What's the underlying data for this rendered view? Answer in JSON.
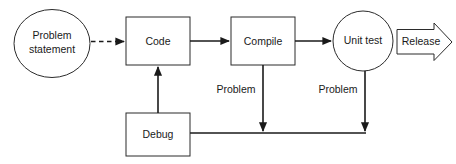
{
  "diagram": {
    "background_color": "#ffffff",
    "stroke_color": "#1a1a1a",
    "shape_stroke_color": "#2b2b2b",
    "nodes": [
      {
        "id": "problem-statement",
        "label_line1": "Problem",
        "label_line2": "statement",
        "shape": "ellipse"
      },
      {
        "id": "code",
        "label": "Code",
        "shape": "rectangle"
      },
      {
        "id": "compile",
        "label": "Compile",
        "shape": "rectangle"
      },
      {
        "id": "unit-test",
        "label": "Unit test",
        "shape": "circle"
      },
      {
        "id": "debug",
        "label": "Debug",
        "shape": "rectangle"
      },
      {
        "id": "release",
        "label": "Release",
        "shape": "block-arrow"
      }
    ],
    "edges": [
      {
        "id": "problem-statement-to-code",
        "from": "problem-statement",
        "to": "code",
        "style": "dashed",
        "label": ""
      },
      {
        "id": "code-to-compile",
        "from": "code",
        "to": "compile",
        "style": "solid",
        "label": ""
      },
      {
        "id": "compile-to-unit-test",
        "from": "compile",
        "to": "unit-test",
        "style": "solid",
        "label": ""
      },
      {
        "id": "unit-test-to-release",
        "from": "unit-test",
        "to": "release",
        "style": "solid",
        "label": ""
      },
      {
        "id": "compile-to-debug",
        "from": "compile",
        "to": "debug",
        "style": "solid",
        "label": "Problem"
      },
      {
        "id": "unit-test-to-debug",
        "from": "unit-test",
        "to": "debug",
        "style": "solid",
        "label": "Problem"
      },
      {
        "id": "debug-to-code",
        "from": "debug",
        "to": "code",
        "style": "solid",
        "label": ""
      }
    ],
    "edge_labels": {
      "compile_problem": "Problem",
      "unit_test_problem": "Problem"
    }
  }
}
